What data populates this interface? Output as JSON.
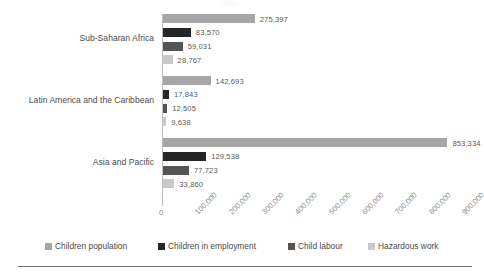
{
  "chart_data": {
    "type": "bar",
    "orientation": "horizontal",
    "title": "",
    "xlabel": "",
    "ylabel": "",
    "xlim": [
      0,
      900000
    ],
    "grid": false,
    "legend_position": "bottom",
    "categories": [
      "Sub-Saharan Africa",
      "Latin America and the Caribbean",
      "Asia and Pacific"
    ],
    "tick_labels": [
      "0",
      "100,000",
      "200,000",
      "300,000",
      "400,000",
      "500,000",
      "600,000",
      "700,000",
      "800,000",
      "900,000"
    ],
    "tick_values": [
      0,
      100000,
      200000,
      300000,
      400000,
      500000,
      600000,
      700000,
      800000,
      900000
    ],
    "series": [
      {
        "name": "Children population",
        "color": "#a6a6a6",
        "values": [
          275397,
          142693,
          853334
        ],
        "labels": [
          "275,397",
          "142,693",
          "853,334"
        ]
      },
      {
        "name": "Children in employment",
        "color": "#262626",
        "values": [
          83570,
          17843,
          129538
        ],
        "labels": [
          "83,570",
          "17,843",
          "129,538"
        ]
      },
      {
        "name": "Child labour",
        "color": "#545454",
        "values": [
          59031,
          12505,
          77723
        ],
        "labels": [
          "59,031",
          "12,505",
          "77,723"
        ]
      },
      {
        "name": "Hazardous work",
        "color": "#c9c9c9",
        "values": [
          28767,
          9638,
          33860
        ],
        "labels": [
          "28,767",
          "9,638",
          "33,860"
        ]
      }
    ]
  },
  "legend": {
    "items": [
      {
        "label": "Children population",
        "color": "#a6a6a6"
      },
      {
        "label": "Children in employment",
        "color": "#262626"
      },
      {
        "label": "Child labour",
        "color": "#545454"
      },
      {
        "label": "Hazardous work",
        "color": "#c9c9c9"
      }
    ]
  },
  "axis": {
    "zero_label": "0"
  }
}
